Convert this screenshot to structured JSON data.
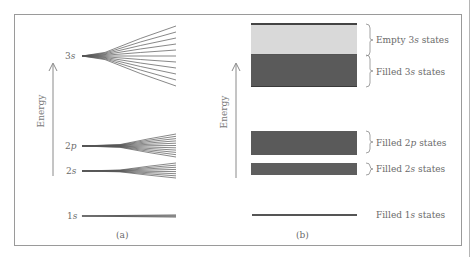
{
  "panel_a": {
    "caption": "(a)",
    "axis_label": "Energy",
    "levels": [
      {
        "name": "3s",
        "n": "3",
        "l": "s",
        "y": 56,
        "fan_top": 26,
        "fan_bottom": 86,
        "lines": 11
      },
      {
        "name": "2p",
        "n": "2",
        "l": "p",
        "y": 146,
        "fan_top": 134,
        "fan_bottom": 157,
        "lines": 11
      },
      {
        "name": "2s",
        "n": "2",
        "l": "s",
        "y": 171,
        "fan_top": 163,
        "fan_bottom": 178,
        "lines": 8
      },
      {
        "name": "1s",
        "n": "1",
        "l": "s",
        "y": 216,
        "fan_top": 215,
        "fan_bottom": 217,
        "lines": 3
      }
    ]
  },
  "panel_b": {
    "caption": "(b)",
    "axis_label": "Energy",
    "bands": [
      {
        "label_pre": "Empty 3",
        "label_ital": "s",
        "label_post": " states",
        "state": "empty",
        "color": "#d9d9d9"
      },
      {
        "label_pre": "Filled 3",
        "label_ital": "s",
        "label_post": " states",
        "state": "filled",
        "color": "#5a5a5a"
      },
      {
        "label_pre": "Filled 2",
        "label_ital": "p",
        "label_post": " states",
        "state": "filled",
        "color": "#5a5a5a"
      },
      {
        "label_pre": "Filled 2",
        "label_ital": "s",
        "label_post": " states",
        "state": "filled",
        "color": "#5a5a5a"
      },
      {
        "label_pre": "Filled 1",
        "label_ital": "s",
        "label_post": " states",
        "state": "filled",
        "color": "#5a5a5a"
      }
    ]
  },
  "colors": {
    "empty_band": "#d9d9d9",
    "filled_band": "#5a5a5a",
    "line": "#555555",
    "frame": "#9a9a9a"
  }
}
